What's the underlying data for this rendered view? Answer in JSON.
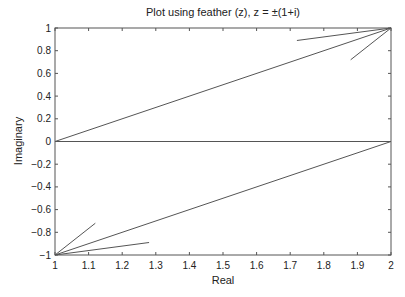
{
  "chart_data": {
    "type": "line",
    "subtype": "feather",
    "title": "Plot using feather (z), z = ±(1+i)",
    "xlabel": "Real",
    "ylabel": "Imaginary",
    "xlim": [
      1,
      2
    ],
    "ylim": [
      -1,
      1
    ],
    "xticks": [
      "1",
      "1.1",
      "1.2",
      "1.3",
      "1.4",
      "1.5",
      "1.6",
      "1.7",
      "1.8",
      "1.9",
      "2"
    ],
    "yticks": [
      "-1",
      "-0.8",
      "-0.6",
      "-0.4",
      "-0.2",
      "0",
      "0.2",
      "0.4",
      "0.6",
      "0.8",
      "1"
    ],
    "grid": false,
    "series": [
      {
        "name": "arrow 1",
        "start": [
          1,
          -1
        ],
        "end": [
          2,
          0
        ]
      },
      {
        "name": "arrow 2",
        "start": [
          1,
          0
        ],
        "end": [
          2,
          1
        ]
      },
      {
        "name": "zero line",
        "start": [
          1,
          0
        ],
        "end": [
          2,
          0
        ]
      }
    ],
    "arrowheads": [
      {
        "tip": [
          2,
          1
        ],
        "barbs": [
          [
            1.72,
            0.89
          ],
          [
            1.88,
            0.72
          ]
        ]
      },
      {
        "tip": [
          1,
          -1
        ],
        "barbs": [
          [
            1.12,
            -0.72
          ],
          [
            1.28,
            -0.89
          ]
        ]
      }
    ],
    "line_color": "#555555"
  }
}
